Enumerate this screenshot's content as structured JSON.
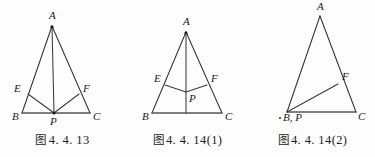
{
  "page": {
    "width": 375,
    "height": 157,
    "background_color": "#ffffff",
    "stroke_color": "#333333",
    "label_color": "#1a1a1a"
  },
  "figures": [
    {
      "id": "fig-4-4-13",
      "caption_cn": "图",
      "caption_number": "4. 4. 13",
      "caption_full": "图 4. 4. 13",
      "description": "Isosceles triangle ABC with median AP to base BC, and segments EP and FP drawn from P to points E on AB and F on AC",
      "points": {
        "A": {
          "label": "A",
          "x": 52,
          "y": 26
        },
        "B": {
          "label": "B",
          "x": 22,
          "y": 113
        },
        "C": {
          "label": "C",
          "x": 90,
          "y": 113
        },
        "P": {
          "label": "P",
          "x": 54,
          "y": 113
        },
        "E": {
          "label": "E",
          "x": 28,
          "y": 94
        },
        "F": {
          "label": "F",
          "x": 79,
          "y": 94
        }
      },
      "segments": [
        {
          "name": "AB",
          "from": "A",
          "to": "B",
          "kind": "edge"
        },
        {
          "name": "AC",
          "from": "A",
          "to": "C",
          "kind": "edge"
        },
        {
          "name": "BC",
          "from": "B",
          "to": "C",
          "kind": "base"
        },
        {
          "name": "AP",
          "from": "A",
          "to": "P",
          "kind": "cevian"
        },
        {
          "name": "EP",
          "from": "E",
          "to": "P",
          "kind": "cevian"
        },
        {
          "name": "FP",
          "from": "F",
          "to": "P",
          "kind": "cevian"
        }
      ]
    },
    {
      "id": "fig-4-4-14-1",
      "caption_cn": "图",
      "caption_number": "4. 4. 14(1)",
      "caption_full": "图 4. 4. 14(1)",
      "description": "Triangle ABC with cevian AQ from apex to base BC; interior point P joined to E on AB and F on AC",
      "points": {
        "A": {
          "label": "A",
          "x": 61,
          "y": 32
        },
        "B": {
          "label": "B",
          "x": 27,
          "y": 113
        },
        "C": {
          "label": "C",
          "x": 97,
          "y": 113
        },
        "P": {
          "label": "P",
          "x": 61,
          "y": 92
        },
        "E": {
          "label": "E",
          "x": 40,
          "y": 85
        },
        "F": {
          "label": "F",
          "x": 82,
          "y": 85
        },
        "Q": {
          "label": "",
          "x": 61,
          "y": 113
        }
      },
      "segments": [
        {
          "name": "AB",
          "from": "A",
          "to": "B",
          "kind": "edge"
        },
        {
          "name": "AC",
          "from": "A",
          "to": "C",
          "kind": "edge"
        },
        {
          "name": "BC",
          "from": "B",
          "to": "C",
          "kind": "base"
        },
        {
          "name": "AQ",
          "from": "A",
          "to": "Q",
          "kind": "cevian"
        },
        {
          "name": "EP",
          "from": "E",
          "to": "P",
          "kind": "cevian"
        },
        {
          "name": "FP",
          "from": "F",
          "to": "P",
          "kind": "cevian"
        }
      ]
    },
    {
      "id": "fig-4-4-14-2",
      "caption_cn": "图",
      "caption_number": "4. 4. 14(2)",
      "caption_full": "图 4. 4. 14(2)",
      "description": "Triangle ABC where P coincides with B; segment BF drawn to point F on side AC",
      "points": {
        "A": {
          "label": "A",
          "x": 70,
          "y": 16
        },
        "BP": {
          "label": "B, P",
          "x": 37,
          "y": 112
        },
        "C": {
          "label": "C",
          "x": 106,
          "y": 112
        },
        "F": {
          "label": "F",
          "x": 88,
          "y": 84
        }
      },
      "segments": [
        {
          "name": "AB",
          "from": "A",
          "to": "BP",
          "kind": "edge"
        },
        {
          "name": "AC",
          "from": "A",
          "to": "C",
          "kind": "edge"
        },
        {
          "name": "BC",
          "from": "BP",
          "to": "C",
          "kind": "base"
        },
        {
          "name": "BF",
          "from": "BP",
          "to": "F",
          "kind": "cevian"
        }
      ]
    }
  ]
}
